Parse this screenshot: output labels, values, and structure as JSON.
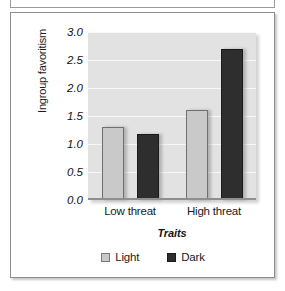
{
  "chart_data": {
    "type": "bar",
    "title": "",
    "xlabel": "Traits",
    "ylabel": "Ingroup favoritism",
    "categories": [
      "Low threat",
      "High threat"
    ],
    "series": [
      {
        "name": "Light",
        "values": [
          1.3,
          1.6
        ],
        "color": "#c9c9c9"
      },
      {
        "name": "Dark",
        "values": [
          1.18,
          2.7
        ],
        "color": "#2e2e2e"
      }
    ],
    "ylim": [
      0.0,
      3.0
    ],
    "yticks": [
      "0.0",
      "0.5",
      "1.0",
      "1.5",
      "2.0",
      "2.5",
      "3.0"
    ],
    "ytick_values": [
      0.0,
      0.5,
      1.0,
      1.5,
      2.0,
      2.5,
      3.0
    ],
    "grid": true,
    "legend_position": "bottom",
    "plot_background": "#e2e2e2",
    "gridline_color": "#f7f7f7"
  },
  "legend": {
    "items": [
      {
        "label": "Light"
      },
      {
        "label": "Dark"
      }
    ]
  }
}
